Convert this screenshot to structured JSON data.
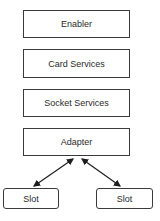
{
  "diagram": {
    "layers": [
      {
        "id": "enabler",
        "label": "Enabler"
      },
      {
        "id": "card-services",
        "label": "Card Services"
      },
      {
        "id": "socket-services",
        "label": "Socket Services"
      },
      {
        "id": "adapter",
        "label": "Adapter"
      }
    ],
    "slots": [
      {
        "id": "slot-left",
        "label": "Slot"
      },
      {
        "id": "slot-right",
        "label": "Slot"
      }
    ],
    "connections": [
      {
        "from": "adapter",
        "to": "slot-left",
        "type": "bidirectional-arrow"
      },
      {
        "from": "adapter",
        "to": "slot-right",
        "type": "bidirectional-arrow"
      }
    ]
  }
}
